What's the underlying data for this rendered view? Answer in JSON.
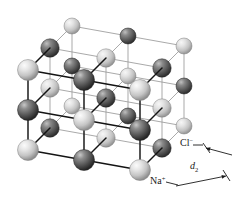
{
  "figure": {
    "name": "nacl-crystal-lattice",
    "projection": "axonometric",
    "grid": {
      "nx": 3,
      "ny": 3,
      "nz": 3
    },
    "labels": {
      "chloride": {
        "text": "Cl",
        "charge": "−",
        "x": 180,
        "y": 146
      },
      "sodium": {
        "text": "Na",
        "charge": "+",
        "x": 150,
        "y": 184
      },
      "spacing": {
        "text": "d",
        "subscript": "2",
        "x": 190,
        "y": 169
      }
    },
    "legend_note": "Light spheres are Na+ ions; dark spheres are Cl- ions.",
    "colors": {
      "sodium_light": "#d8d8d8",
      "sodium_highlight": "#f4f4f4",
      "sodium_shadow": "#8d8d8d",
      "chloride_dark": "#636363",
      "chloride_highlight": "#b8b8b8",
      "chloride_shadow": "#2b2b2b",
      "bond_front": "#141414",
      "bond_back": "#9a9a9a",
      "label_color": "#1a1a1a",
      "background": "#ffffff"
    },
    "geometry": {
      "origin": {
        "x": 28,
        "y": 150
      },
      "vec_right": {
        "x": 56,
        "y": 10
      },
      "vec_up": {
        "x": 0,
        "y": -40
      },
      "vec_depth": {
        "x": 22,
        "y": -22
      },
      "radius_front": 10.5,
      "radius_back": 8.0
    },
    "dimension_arrows": {
      "upper": {
        "x1": 206,
        "y1": 148,
        "x2": 232,
        "y2": 155
      },
      "lower": {
        "x1": 176,
        "y1": 186,
        "x2": 226,
        "y2": 176
      },
      "tick_upper": {
        "x1": 203,
        "y1": 143,
        "x2": 210,
        "y2": 153
      },
      "tick_lower": {
        "x1": 223,
        "y1": 170,
        "x2": 230,
        "y2": 181
      }
    }
  }
}
